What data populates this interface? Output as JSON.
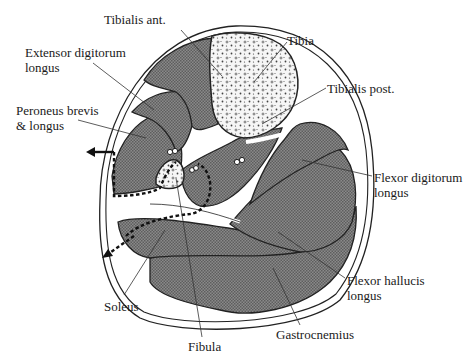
{
  "figure": {
    "colors": {
      "muscle_fill": "#7a7a7a",
      "bone_fill": "#f4f4f4",
      "outline": "#222222",
      "background": "#ffffff"
    }
  },
  "labels": {
    "tibialis_ant": "Tibialis ant.",
    "extensor_digitorum_1": "Extensor digitorum",
    "extensor_digitorum_2": "longus",
    "peroneus_1": "Peroneus brevis",
    "peroneus_2": "& longus",
    "tibia": "Tibia",
    "tibialis_post": "Tibialis post.",
    "flexor_digitorum_1": "Flexor digitorum",
    "flexor_digitorum_2": "longus",
    "flexor_hallucis_1": "Flexor hallucis",
    "flexor_hallucis_2": "longus",
    "soleus": "Soleus",
    "fibula": "Fibula",
    "gastrocnemius": "Gastrocnemius"
  }
}
